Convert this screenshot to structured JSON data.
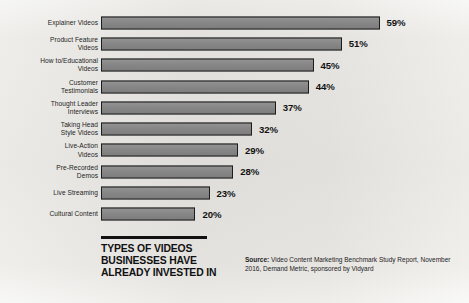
{
  "chart_data": {
    "type": "bar",
    "orientation": "horizontal",
    "title": "TYPES OF VIDEOS\nBUSINESSES HAVE\nALREADY INVESTED IN",
    "xlabel": "",
    "ylabel": "",
    "xlim": [
      0,
      72
    ],
    "grid": false,
    "legend": null,
    "value_suffix": "%",
    "categories": [
      "Explainer Videos",
      "Product Feature\nVideos",
      "How to/Educational\nVideos",
      "Customer\nTestimonials",
      "Thought Leader\nInterviews",
      "Taking Head\nStyle Videos",
      "Live-Action\nVideos",
      "Pre-Recorded\nDemos",
      "Live Streaming",
      "Cultural Content"
    ],
    "values": [
      59,
      51,
      45,
      44,
      37,
      32,
      29,
      28,
      23,
      20
    ],
    "value_labels": [
      "59%",
      "51%",
      "45%",
      "44%",
      "37%",
      "32%",
      "29%",
      "28%",
      "23%",
      "20%"
    ],
    "bar_color": "#878787",
    "bar_border_color": "#1c1c1c",
    "background_color": "#f2f1ef",
    "text_color": "#1a1a1a"
  },
  "footer": {
    "source_label": "Source:",
    "source_text": " Video Content Marketing Benchmark Study Report, November 2016, Demand Metric, sponsored by Vidyard"
  }
}
